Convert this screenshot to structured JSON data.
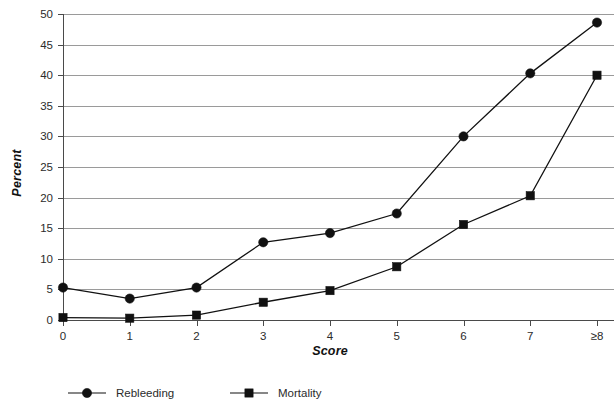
{
  "chart_data": {
    "type": "line",
    "title": "",
    "xlabel": "Score",
    "ylabel": "Percent",
    "categories": [
      "0",
      "1",
      "2",
      "3",
      "4",
      "5",
      "6",
      "7",
      "≥8"
    ],
    "x_tick_labels": [
      "0",
      "1",
      "2",
      "3",
      "4",
      "5",
      "6",
      "7",
      "≥8"
    ],
    "y_tick_labels": [
      "0",
      "5",
      "10",
      "15",
      "20",
      "25",
      "30",
      "35",
      "40",
      "45",
      "50"
    ],
    "y_ticks": [
      0,
      5,
      10,
      15,
      20,
      25,
      30,
      35,
      40,
      45,
      50
    ],
    "ylim": [
      0,
      50
    ],
    "grid": true,
    "legend_position": "bottom",
    "series": [
      {
        "name": "Rebleeding",
        "marker": "circle",
        "color": "#111111",
        "values": [
          5.3,
          3.5,
          5.3,
          12.7,
          14.2,
          17.4,
          30.0,
          40.3,
          48.6
        ]
      },
      {
        "name": "Mortality",
        "marker": "square",
        "color": "#111111",
        "values": [
          0.4,
          0.3,
          0.8,
          2.9,
          4.8,
          8.7,
          15.6,
          20.3,
          40.0
        ]
      }
    ]
  },
  "legend": {
    "items": [
      {
        "label": "Rebleeding",
        "marker": "circle"
      },
      {
        "label": "Mortality",
        "marker": "square"
      }
    ]
  },
  "colors": {
    "gridline": "#9a9a9a",
    "axis": "#4a4a4a",
    "series": "#111111",
    "background": "#ffffff"
  }
}
